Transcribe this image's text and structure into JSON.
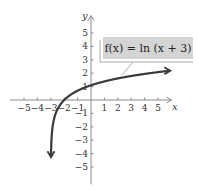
{
  "chart_data": {
    "type": "line",
    "title": "",
    "function": "f(x) = ln (x + 3)",
    "xlabel": "x",
    "ylabel": "y",
    "xlim": [
      -5.5,
      6
    ],
    "ylim": [
      -6,
      6
    ],
    "x_ticks": [
      -5,
      -4,
      -3,
      -2,
      -1,
      1,
      2,
      3,
      4,
      5
    ],
    "y_ticks": [
      -5,
      -4,
      -3,
      -2,
      -1,
      1,
      2,
      3,
      4,
      5
    ],
    "x_tick_labels": [
      "−5",
      "−4",
      "−3",
      "−2",
      "−1",
      "1",
      "2",
      "3",
      "4",
      "5"
    ],
    "y_tick_labels": [
      "−5",
      "−4",
      "−3",
      "−2",
      "−1",
      "1",
      "2",
      "3",
      "4",
      "5"
    ],
    "grid": false,
    "series": [
      {
        "name": "f(x) = ln (x + 3)",
        "x": [
          -2.95,
          -2.9,
          -2.8,
          -2.6,
          -2.4,
          -2,
          -1.5,
          -1,
          0,
          1,
          2,
          3,
          4,
          5,
          6
        ],
        "values": [
          -3.0,
          -2.3,
          -1.61,
          -0.92,
          -0.51,
          0,
          0.41,
          0.69,
          1.1,
          1.39,
          1.61,
          1.79,
          1.95,
          2.08,
          2.2
        ]
      }
    ],
    "annotations": [
      {
        "text": "f(x) = ln (x + 3)",
        "position": "upper right, boxed with leader line to curve"
      }
    ],
    "colors": {
      "curve": "#3a3a3a",
      "axes": "#8a8a8a",
      "label_box": "#d4d4d4"
    }
  },
  "labels": {
    "x_axis": "x",
    "y_axis": "y",
    "function": "f(x) = ln (x + 3)"
  }
}
